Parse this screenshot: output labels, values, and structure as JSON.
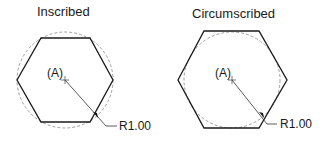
{
  "figures": [
    {
      "title": "Inscribed",
      "center_label": "(A)",
      "radius_label": "R1.00",
      "center": [
        65,
        80
      ],
      "circle_radius": 48,
      "hexagon_points": "17,80 41,38 90,38 113,80 90,122 41,122"
    },
    {
      "title": "Circumscribed",
      "center_label": "(A)",
      "radius_label": "R1.00",
      "center": [
        232,
        80
      ],
      "circle_radius": 48,
      "hexagon_points": "178,80 204,31 259,31 287,80 259,128 204,128"
    }
  ],
  "colors": {
    "line": "#1a1a1a",
    "dashed_circle": "#888888"
  }
}
